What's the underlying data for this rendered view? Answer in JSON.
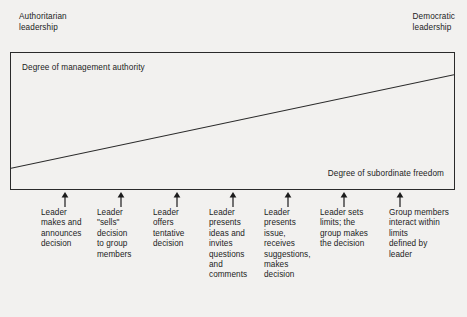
{
  "figure": {
    "type": "leadership-continuum-diagram",
    "top_left_caption": "Authoritarian\nleadership",
    "top_right_caption": "Democratic\nleadership",
    "box": {
      "upper_label": "Degree of management authority",
      "lower_label": "Degree of subordinate freedom"
    },
    "diagonal_line": {
      "description": "Diagonal line rising from lower-left to upper-right across the box",
      "start": {
        "x": 0,
        "y": 117
      },
      "end": {
        "x": 445,
        "y": 22
      }
    },
    "steps": [
      {
        "index": 1,
        "arrow": "arrow-up-icon",
        "label": "Leader\nmakes and\nannounces\ndecision"
      },
      {
        "index": 2,
        "arrow": "arrow-up-icon",
        "label": "Leader\n\"sells\"\ndecision\nto group\nmembers"
      },
      {
        "index": 3,
        "arrow": "arrow-up-icon",
        "label": "Leader\noffers\ntentative\ndecision"
      },
      {
        "index": 4,
        "arrow": "arrow-up-icon",
        "label": "Leader\npresents\nideas and\ninvites\nquestions\nand\ncomments"
      },
      {
        "index": 5,
        "arrow": "arrow-up-icon",
        "label": "Leader\npresents\nissue,\nreceives\nsuggestions,\nmakes\ndecision"
      },
      {
        "index": 6,
        "arrow": "arrow-up-icon",
        "label": "Leader sets\nlimits; the\ngroup makes\nthe decision"
      },
      {
        "index": 7,
        "arrow": "arrow-up-icon",
        "label": "Group members\ninteract within\nlimits\ndefined by\nleader"
      }
    ],
    "colors": {
      "background": "#f2f1ef",
      "ink": "#1c1c1c",
      "border": "#2a2a2a"
    }
  }
}
